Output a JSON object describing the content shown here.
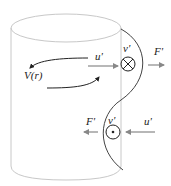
{
  "diagram": {
    "labels": {
      "velocity_profile": "V(r)",
      "perturbation_upper": "u'",
      "perturbation_lower": "u'",
      "transverse_upper": "v'",
      "transverse_lower": "v'",
      "force_upper": "F'",
      "force_lower": "F'"
    },
    "symbols": {
      "into_page": "circle-cross",
      "out_of_page": "circle-dot"
    },
    "colors": {
      "cylinder_outline": "#c8c8c8",
      "wave_line": "#444444",
      "arrow_gray": "#888888",
      "flow_arrow": "#333333",
      "text": "#222222"
    }
  }
}
